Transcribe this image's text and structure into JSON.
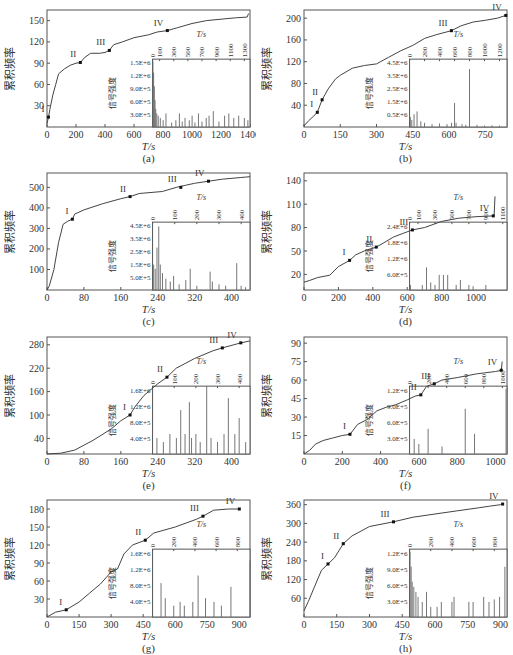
{
  "figure": {
    "y_label": "累积频率",
    "x_label": "T/s",
    "inset_y_label": "信号强度",
    "inset_x_label": "T/s"
  },
  "chart_data": [
    {
      "id": "a",
      "caption": "(a)",
      "type": "line",
      "xlabel": "T/s",
      "ylabel": "累积频率",
      "xlim": [
        0,
        1400
      ],
      "ylim": [
        0,
        165
      ],
      "xticks": [
        0,
        200,
        400,
        600,
        800,
        1000,
        1200,
        1400
      ],
      "yticks": [
        30,
        60,
        90,
        120,
        150
      ],
      "x": [
        0,
        10,
        20,
        40,
        60,
        80,
        120,
        160,
        200,
        230,
        260,
        300,
        360,
        400,
        430,
        460,
        520,
        600,
        700,
        760,
        830,
        900,
        1000,
        1100,
        1200,
        1300,
        1380,
        1390
      ],
      "y": [
        5,
        14,
        25,
        45,
        60,
        75,
        82,
        87,
        90,
        91,
        98,
        104,
        104,
        105,
        108,
        116,
        120,
        126,
        130,
        134,
        136,
        140,
        146,
        150,
        152,
        154,
        155,
        160
      ],
      "stage_markers": [
        {
          "label": "I",
          "x": 10,
          "y": 14
        },
        {
          "label": "II",
          "x": 230,
          "y": 91
        },
        {
          "label": "III",
          "x": 430,
          "y": 108
        },
        {
          "label": "IV",
          "x": 830,
          "y": 136
        }
      ],
      "inset": {
        "type": "bar",
        "xlabel": "T/s",
        "ylabel": "信号强度",
        "xticks": [
          0,
          100,
          300,
          500,
          700,
          900,
          1100,
          1300
        ],
        "xlim": [
          0,
          1380
        ],
        "yticks": [
          "3.0E+5",
          "6.0E+5",
          "9.0E+5",
          "1.2E+6",
          "1.5E+6"
        ],
        "ylim": [
          0,
          1500000
        ],
        "spikes_x": [
          5,
          15,
          25,
          35,
          45,
          60,
          80,
          110,
          150,
          190,
          270,
          330,
          380,
          420,
          460,
          520,
          560,
          600,
          650,
          700,
          760,
          800,
          860,
          940,
          1020,
          1080,
          1150,
          1220,
          1300,
          1350
        ],
        "spikes_y": [
          1450000,
          1200000,
          900000,
          600000,
          400000,
          300000,
          250000,
          200000,
          150000,
          300000,
          100000,
          150000,
          300000,
          120000,
          200000,
          150000,
          250000,
          100000,
          300000,
          120000,
          200000,
          250000,
          350000,
          120000,
          250000,
          300000,
          200000,
          250000,
          200000,
          150000
        ]
      }
    },
    {
      "id": "b",
      "caption": "(b)",
      "type": "line",
      "xlabel": "T/s",
      "ylabel": "累积频率",
      "xlim": [
        0,
        840
      ],
      "ylim": [
        0,
        215
      ],
      "xticks": [
        0,
        150,
        300,
        450,
        600,
        750
      ],
      "yticks": [
        40,
        80,
        120,
        160,
        200
      ],
      "x": [
        0,
        20,
        40,
        55,
        75,
        100,
        130,
        150,
        200,
        250,
        300,
        350,
        400,
        450,
        500,
        550,
        610,
        650,
        700,
        750,
        800,
        835
      ],
      "y": [
        2,
        12,
        20,
        27,
        50,
        70,
        88,
        95,
        108,
        113,
        116,
        128,
        140,
        150,
        163,
        170,
        177,
        186,
        193,
        196,
        200,
        205
      ],
      "stage_markers": [
        {
          "label": "I",
          "x": 55,
          "y": 27
        },
        {
          "label": "II",
          "x": 75,
          "y": 50
        },
        {
          "label": "III",
          "x": 610,
          "y": 177
        },
        {
          "label": "IV",
          "x": 835,
          "y": 205
        }
      ],
      "inset": {
        "type": "bar",
        "xlabel": "T/s",
        "ylabel": "信号强度",
        "xticks": [
          0,
          200,
          400,
          600,
          800,
          1000,
          1200
        ],
        "xlim": [
          0,
          1300
        ],
        "yticks": [
          "0.5E+6",
          "1.5E+6",
          "2.5E+6",
          "3.5E+6",
          "4.5E+6"
        ],
        "ylim": [
          0,
          4800000
        ],
        "spikes_x": [
          10,
          30,
          60,
          100,
          150,
          200,
          300,
          400,
          500,
          560,
          600,
          620,
          700,
          750,
          800,
          900,
          1000,
          1100,
          1200
        ],
        "spikes_y": [
          700000,
          500000,
          900000,
          1100000,
          400000,
          300000,
          200000,
          250000,
          200000,
          300000,
          1700000,
          300000,
          200000,
          150000,
          4100000,
          150000,
          100000,
          120000,
          100000
        ]
      }
    },
    {
      "id": "c",
      "caption": "(c)",
      "type": "line",
      "xlabel": "T/s",
      "ylabel": "累积频率",
      "xlim": [
        0,
        440
      ],
      "ylim": [
        0,
        570
      ],
      "xticks": [
        0,
        80,
        160,
        240,
        320,
        400
      ],
      "yticks": [
        100,
        200,
        300,
        400,
        500
      ],
      "x": [
        0,
        5,
        15,
        25,
        35,
        45,
        55,
        60,
        80,
        120,
        160,
        180,
        200,
        250,
        280,
        300,
        320,
        350,
        380,
        420,
        440
      ],
      "y": [
        0,
        20,
        100,
        230,
        320,
        335,
        345,
        370,
        390,
        420,
        445,
        455,
        470,
        480,
        500,
        510,
        520,
        530,
        540,
        548,
        552
      ],
      "stage_markers": [
        {
          "label": "I",
          "x": 55,
          "y": 345
        },
        {
          "label": "II",
          "x": 180,
          "y": 455
        },
        {
          "label": "III",
          "x": 290,
          "y": 500
        },
        {
          "label": "IV",
          "x": 350,
          "y": 530
        }
      ],
      "inset": {
        "type": "bar",
        "xlabel": "T/s",
        "ylabel": "信号强度",
        "xticks": [
          0,
          100,
          200,
          300,
          400
        ],
        "xlim": [
          0,
          440
        ],
        "yticks": [
          "5.0E+5",
          "1.5E+6",
          "2.5E+6",
          "3.5E+6",
          "4.5E+6"
        ],
        "ylim": [
          0,
          4800000
        ],
        "spikes_x": [
          5,
          12,
          20,
          28,
          35,
          45,
          60,
          80,
          95,
          120,
          150,
          170,
          200,
          260,
          270,
          300,
          330,
          380,
          400,
          420
        ],
        "spikes_y": [
          1800000,
          1500000,
          3000000,
          4500000,
          1800000,
          1200000,
          800000,
          600000,
          1000000,
          400000,
          700000,
          1500000,
          300000,
          1300000,
          600000,
          400000,
          300000,
          1900000,
          300000,
          200000
        ]
      }
    },
    {
      "id": "d",
      "caption": "(d)",
      "type": "line",
      "xlabel": "T/s",
      "ylabel": "累积频率",
      "xlim": [
        0,
        1180
      ],
      "ylim": [
        0,
        150
      ],
      "xticks": [
        0,
        200,
        400,
        600,
        800,
        1000
      ],
      "yticks": [
        20,
        50,
        80,
        110,
        140
      ],
      "x": [
        0,
        30,
        80,
        150,
        200,
        265,
        300,
        350,
        420,
        460,
        520,
        580,
        630,
        700,
        750,
        800,
        900,
        1000,
        1100,
        1105,
        1110
      ],
      "y": [
        10,
        12,
        16,
        19,
        30,
        38,
        45,
        50,
        55,
        60,
        68,
        73,
        77,
        80,
        84,
        88,
        92,
        94,
        95,
        95,
        120
      ],
      "stage_markers": [
        {
          "label": "I",
          "x": 265,
          "y": 38
        },
        {
          "label": "II",
          "x": 420,
          "y": 55
        },
        {
          "label": "III",
          "x": 630,
          "y": 77
        },
        {
          "label": "IV",
          "x": 1100,
          "y": 95
        }
      ],
      "inset": {
        "type": "bar",
        "xlabel": "T/s",
        "ylabel": "信号强度",
        "xticks": [
          0,
          100,
          300,
          500,
          700,
          900,
          1100
        ],
        "xlim": [
          0,
          1150
        ],
        "yticks": [
          "6.0E+5",
          "1.2E+6",
          "1.8E+6",
          "2.4E+6"
        ],
        "ylim": [
          0,
          2700000
        ],
        "spikes_x": [
          10,
          150,
          200,
          250,
          300,
          350,
          400,
          450,
          550,
          600,
          700,
          750,
          900
        ],
        "spikes_y": [
          200000,
          200000,
          900000,
          300000,
          200000,
          600000,
          600000,
          600000,
          200000,
          400000,
          200000,
          150000,
          200000
        ]
      }
    },
    {
      "id": "e",
      "caption": "(e)",
      "type": "line",
      "xlabel": "T/s",
      "ylabel": "累积频率",
      "xlim": [
        0,
        440
      ],
      "ylim": [
        0,
        300
      ],
      "xticks": [
        0,
        80,
        160,
        240,
        320,
        400
      ],
      "yticks": [
        40,
        100,
        160,
        220,
        280
      ],
      "x": [
        0,
        30,
        60,
        100,
        140,
        160,
        180,
        190,
        210,
        240,
        260,
        280,
        320,
        360,
        380,
        420,
        440
      ],
      "y": [
        0,
        2,
        10,
        35,
        65,
        85,
        100,
        120,
        150,
        180,
        197,
        220,
        245,
        265,
        272,
        285,
        290
      ],
      "stage_markers": [
        {
          "label": "I",
          "x": 180,
          "y": 100
        },
        {
          "label": "II",
          "x": 260,
          "y": 197
        },
        {
          "label": "III",
          "x": 380,
          "y": 272
        },
        {
          "label": "IV",
          "x": 420,
          "y": 285
        }
      ],
      "inset": {
        "type": "bar",
        "xlabel": "T/s",
        "ylabel": "信号强度",
        "xticks": [
          0,
          100,
          200,
          300,
          400
        ],
        "xlim": [
          0,
          450
        ],
        "yticks": [
          "4.0E+5",
          "8.0E+5",
          "1.2E+6",
          "1.6E+6"
        ],
        "ylim": [
          0,
          1700000
        ],
        "spikes_x": [
          20,
          50,
          80,
          110,
          130,
          150,
          170,
          180,
          200,
          220,
          250,
          270,
          300,
          330,
          350,
          380,
          400,
          430
        ],
        "spikes_y": [
          400000,
          300000,
          500000,
          400000,
          1100000,
          500000,
          1300000,
          400000,
          500000,
          300000,
          1700000,
          400000,
          300000,
          500000,
          1400000,
          500000,
          900000,
          300000
        ]
      }
    },
    {
      "id": "f",
      "caption": "(f)",
      "type": "line",
      "xlabel": "T/s",
      "ylabel": "累积频率",
      "xlim": [
        0,
        1060
      ],
      "ylim": [
        0,
        95
      ],
      "xticks": [
        0,
        200,
        400,
        600,
        800,
        1000
      ],
      "yticks": [
        15,
        30,
        45,
        60,
        75,
        90
      ],
      "x": [
        0,
        30,
        60,
        100,
        150,
        200,
        240,
        280,
        330,
        380,
        430,
        480,
        540,
        580,
        610,
        640,
        680,
        720,
        800,
        900,
        1000,
        1030,
        1035
      ],
      "y": [
        0,
        3,
        8,
        11,
        13,
        15,
        16,
        24,
        28,
        35,
        38,
        40,
        44,
        47,
        48,
        55,
        57,
        60,
        62,
        65,
        67,
        68,
        75
      ],
      "stage_markers": [
        {
          "label": "I",
          "x": 240,
          "y": 16
        },
        {
          "label": "II",
          "x": 610,
          "y": 48
        },
        {
          "label": "III",
          "x": 680,
          "y": 57
        },
        {
          "label": "IV",
          "x": 1030,
          "y": 68
        }
      ],
      "inset": {
        "type": "bar",
        "xlabel": "T/s",
        "ylabel": "信号强度",
        "xticks": [
          0,
          200,
          400,
          600,
          800,
          1000
        ],
        "xlim": [
          0,
          1050
        ],
        "yticks": [
          "3.0E+5",
          "6.0E+5",
          "9.0E+5",
          "1.2E+6"
        ],
        "ylim": [
          0,
          1350000
        ],
        "spikes_x": [
          50,
          100,
          200,
          350,
          600,
          700,
          1040
        ],
        "spikes_y": [
          300000,
          200000,
          500000,
          150000,
          900000,
          400000,
          1300000
        ]
      }
    },
    {
      "id": "g",
      "caption": "(g)",
      "type": "line",
      "xlabel": "T/s",
      "ylabel": "累积频率",
      "xlim": [
        0,
        950
      ],
      "ylim": [
        0,
        195
      ],
      "xticks": [
        0,
        150,
        300,
        450,
        600,
        750,
        900
      ],
      "yticks": [
        30,
        60,
        90,
        120,
        150,
        180
      ],
      "x": [
        0,
        40,
        90,
        150,
        200,
        250,
        300,
        330,
        360,
        400,
        460,
        500,
        600,
        700,
        730,
        780,
        850,
        900
      ],
      "y": [
        0,
        8,
        12,
        25,
        40,
        55,
        75,
        80,
        105,
        120,
        128,
        140,
        150,
        163,
        168,
        178,
        180,
        180
      ],
      "stage_markers": [
        {
          "label": "I",
          "x": 90,
          "y": 12
        },
        {
          "label": "II",
          "x": 460,
          "y": 128
        },
        {
          "label": "III",
          "x": 730,
          "y": 168
        },
        {
          "label": "IV",
          "x": 900,
          "y": 180
        }
      ],
      "inset": {
        "type": "bar",
        "xlabel": "T/s",
        "ylabel": "信号强度",
        "xticks": [
          0,
          200,
          400,
          600,
          800
        ],
        "xlim": [
          0,
          920
        ],
        "yticks": [
          "4.0E+5",
          "8.0E+5",
          "1.2E+6",
          "1.6E+6"
        ],
        "ylim": [
          0,
          1800000
        ],
        "spikes_x": [
          80,
          120,
          200,
          260,
          300,
          380,
          430,
          500,
          580,
          650,
          740,
          920
        ],
        "spikes_y": [
          900000,
          500000,
          300000,
          400000,
          300000,
          400000,
          1100000,
          500000,
          400000,
          300000,
          800000,
          1500000
        ]
      }
    },
    {
      "id": "h",
      "caption": "(h)",
      "type": "line",
      "xlabel": "T/s",
      "ylabel": "累积频率",
      "xlim": [
        0,
        930
      ],
      "ylim": [
        0,
        375
      ],
      "xticks": [
        0,
        150,
        300,
        450,
        600,
        750,
        900
      ],
      "yticks": [
        60,
        120,
        180,
        240,
        300,
        360
      ],
      "x": [
        0,
        20,
        50,
        80,
        110,
        140,
        180,
        220,
        300,
        410,
        500,
        600,
        700,
        800,
        850,
        900,
        910
      ],
      "y": [
        20,
        50,
        100,
        150,
        170,
        190,
        235,
        260,
        290,
        305,
        320,
        330,
        340,
        350,
        355,
        360,
        362
      ],
      "stage_markers": [
        {
          "label": "I",
          "x": 110,
          "y": 170
        },
        {
          "label": "II",
          "x": 180,
          "y": 235
        },
        {
          "label": "III",
          "x": 410,
          "y": 305
        },
        {
          "label": "IV",
          "x": 910,
          "y": 362
        }
      ],
      "inset": {
        "type": "bar",
        "xlabel": "T/s",
        "ylabel": "信号强度",
        "xticks": [
          0,
          200,
          400,
          600,
          800
        ],
        "xlim": [
          0,
          920
        ],
        "yticks": [
          "3.0E+5",
          "6.0E+5",
          "9.0E+5",
          "1.2E+6"
        ],
        "ylim": [
          0,
          1350000
        ],
        "spikes_x": [
          5,
          15,
          25,
          40,
          60,
          80,
          120,
          160,
          200,
          260,
          300,
          400,
          420,
          560,
          600,
          700,
          750,
          800,
          850,
          900
        ],
        "spikes_y": [
          1300000,
          1000000,
          700000,
          600000,
          500000,
          400000,
          300000,
          500000,
          200000,
          200000,
          300000,
          300000,
          400000,
          300000,
          300000,
          400000,
          300000,
          350000,
          400000,
          1000000
        ]
      }
    }
  ]
}
